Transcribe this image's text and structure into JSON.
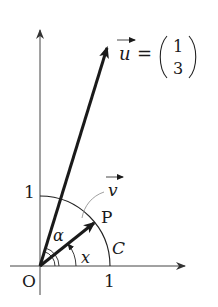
{
  "diagram": {
    "type": "unit-circle-vectors",
    "labels": {
      "origin": "O",
      "x_tick": "1",
      "y_tick": "1",
      "point_p": "P",
      "curve_c": "C",
      "angle_x": "x",
      "angle_alpha": "α",
      "vector_v": "v",
      "vector_u": "u",
      "equals": "=",
      "u_component_1": "1",
      "u_component_2": "3"
    },
    "vectors": [
      {
        "name": "u",
        "components": [
          1,
          3
        ]
      },
      {
        "name": "v",
        "to_point": "P",
        "on_curve": "C"
      }
    ],
    "colors": {
      "ink": "#1a1a1a",
      "axis": "#444444",
      "background": "#ffffff"
    }
  }
}
